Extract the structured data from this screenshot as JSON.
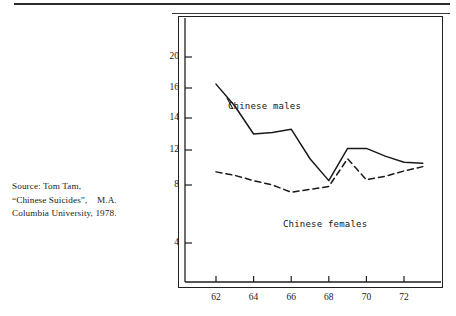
{
  "page": {
    "rule_top": "horizontal-rule",
    "source_note": {
      "line1": "Source: Tom Tam,",
      "line2": "“Chinese Suicides”,    M.A.",
      "line3": "Columbia University, 1978."
    }
  },
  "chart_data": {
    "type": "line",
    "title": "",
    "subtitle": "",
    "xlabel": "",
    "ylabel": "",
    "grid": false,
    "legend_position": "inline-annotation",
    "x": [
      62,
      63,
      64,
      65,
      66,
      67,
      68,
      69,
      70,
      71,
      72,
      73
    ],
    "x_tick_labels": [
      "62",
      "64",
      "66",
      "68",
      "70",
      "72"
    ],
    "x_tick_values": [
      62,
      64,
      66,
      68,
      70,
      72
    ],
    "y_tick_labels": [
      "20",
      "16",
      "14",
      "12",
      "8",
      "4"
    ],
    "y_tick_values": [
      20,
      16,
      14,
      12,
      8,
      4
    ],
    "xlim": [
      61,
      74
    ],
    "ylim": [
      2,
      22
    ],
    "series": [
      {
        "name": "Chinese males",
        "style": "solid",
        "color": "#1a1a1a",
        "values": [
          16.5,
          14.8,
          13.0,
          13.1,
          13.3,
          11.0,
          8.5,
          12.1,
          12.1,
          11.3,
          10.6,
          10.5
        ]
      },
      {
        "name": "Chinese females",
        "style": "dashed",
        "color": "#1a1a1a",
        "values": [
          9.5,
          9.1,
          8.5,
          8.0,
          7.5,
          7.7,
          7.9,
          11.0,
          8.6,
          9.0,
          9.6,
          10.1
        ]
      }
    ],
    "annotations": [
      {
        "text": "Chinese males",
        "x": 63.0,
        "y": 15.1
      },
      {
        "text": "Chinese females",
        "x": 67.0,
        "y": 5.9
      }
    ]
  }
}
